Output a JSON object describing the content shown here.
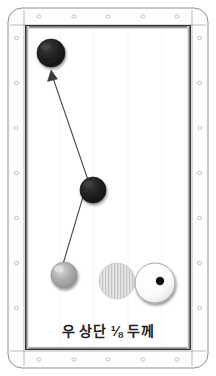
{
  "diagram": {
    "kind": "billiards-table-diagram",
    "caption": "우 상단 ⅛ 두께",
    "table": {
      "outer_width": 200,
      "outer_height": 360,
      "corner_radius": 14,
      "rail_color": "#fdfdfd",
      "rail_stroke": "#8a8a8a",
      "cushion_stroke": "#2b2b2b",
      "cloth_color": "#ffffff",
      "diamond_color": "#b9b9b9",
      "diamonds_top": 5,
      "diamonds_bottom": 5,
      "diamonds_left": 7,
      "diamonds_right": 7
    },
    "balls": [
      {
        "name": "target-ball-upper-left",
        "label": "black-ball-1",
        "color": "#1c1c1c",
        "cx": 51,
        "cy": 53,
        "r": 14,
        "type": "solid-dark"
      },
      {
        "name": "target-ball-middle",
        "label": "black-ball-2",
        "color": "#1c1c1c",
        "cx": 93,
        "cy": 190,
        "r": 13,
        "type": "solid-dark"
      },
      {
        "name": "cue-ball",
        "label": "gray-ball",
        "color": "#a8a8a8",
        "cx": 64,
        "cy": 275,
        "r": 13,
        "type": "solid-gray"
      },
      {
        "name": "striped-ball",
        "label": "hatched-ball",
        "color": "#d6d6d6",
        "cx": 117,
        "cy": 281,
        "r": 18,
        "type": "striped"
      },
      {
        "name": "white-ball-with-dot",
        "label": "white-ball",
        "color": "#ffffff",
        "cx": 155,
        "cy": 283,
        "r": 20,
        "type": "white-dot",
        "dot_color": "#111111",
        "dot_cx": 160,
        "dot_cy": 281,
        "dot_r": 4
      }
    ],
    "shot_path": {
      "name": "shot-trajectory",
      "stroke": "#4a4a4a",
      "width": 1.1,
      "points": [
        {
          "x": 63,
          "y": 264
        },
        {
          "x": 88,
          "y": 180
        },
        {
          "x": 51,
          "y": 74
        }
      ],
      "arrow_at": "end",
      "arrow_head": {
        "x": 51,
        "y": 72,
        "size": 7
      }
    }
  }
}
